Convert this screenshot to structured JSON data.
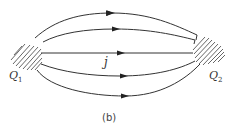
{
  "diagram": {
    "caption": "(b)",
    "current_label": "j",
    "electrodes": [
      {
        "id": "Q1",
        "label": "Q",
        "subscript": "1",
        "side": "left"
      },
      {
        "id": "Q2",
        "label": "Q",
        "subscript": "2",
        "side": "right"
      }
    ],
    "flow_lines": [
      {
        "name": "outer-top",
        "direction": "left-to-right",
        "arrow": true
      },
      {
        "name": "inner-top",
        "direction": "left-to-right",
        "arrow": true
      },
      {
        "name": "center",
        "direction": "left-to-right",
        "arrow": true
      },
      {
        "name": "inner-bottom",
        "direction": "left-to-right",
        "arrow": true
      },
      {
        "name": "outer-bottom",
        "direction": "left-to-right",
        "arrow": true
      }
    ],
    "colors": {
      "stroke": "#333333",
      "hatch": "#555555",
      "background": "#ffffff"
    }
  }
}
